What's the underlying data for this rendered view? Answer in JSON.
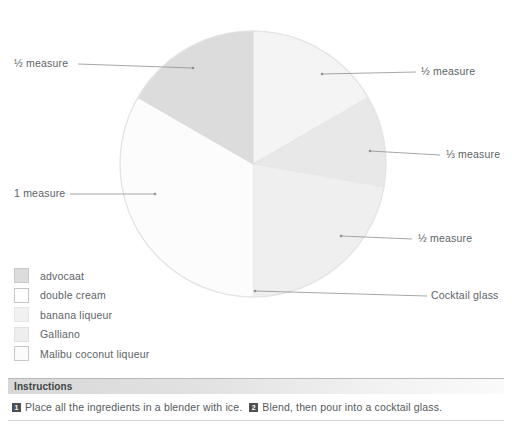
{
  "chart_data": {
    "type": "pie",
    "title": "",
    "center": {
      "x": 253,
      "y": 164
    },
    "radius": 133,
    "legend_position": "bottom-left",
    "grid": false,
    "categories": [
      "advocaat",
      "double cream",
      "banana liqueur",
      "Galliano",
      "Malibu coconut liqueur"
    ],
    "values": [
      0.5,
      1,
      0.5,
      0.333,
      0.5
    ],
    "value_labels": [
      "½ measure",
      "1 measure",
      "½ measure",
      "⅓ measure",
      "½ measure"
    ],
    "colors": [
      "#dcdcdc",
      "#fcfcfc",
      "#f3f3f3",
      "#e7e7e7",
      "#efefef"
    ],
    "annotations": [
      "Cocktail glass"
    ]
  },
  "pie": {
    "segments": [
      {
        "name": "advocaat",
        "label": "½ measure",
        "color": "#dcdcdc",
        "start": 300,
        "end": 360
      },
      {
        "name": "double cream",
        "label": "1 measure",
        "color": "#fcfcfc",
        "start": 180,
        "end": 300
      },
      {
        "name": "banana liqueur",
        "label": "½ measure",
        "color": "#f4f4f4",
        "start": 0,
        "end": 60
      },
      {
        "name": "Galliano",
        "label": "⅓ measure",
        "color": "#e8e8e8",
        "start": 60,
        "end": 100
      },
      {
        "name": "Malibu coconut liqueur",
        "label": "½ measure",
        "color": "#efefef",
        "start": 100,
        "end": 180
      }
    ],
    "glass_label": "Cocktail glass"
  },
  "callouts": {
    "top_left": "½ measure",
    "top_right": "½ measure",
    "mid_right": "⅓ measure",
    "low_right": "½ measure",
    "left": "1 measure",
    "bottom_right": "Cocktail glass"
  },
  "legend": {
    "items": [
      {
        "label": "advocaat",
        "color": "#dcdcdc",
        "border": "#c9c9c9"
      },
      {
        "label": "double cream",
        "color": "#ffffff",
        "border": "#c4c4c4"
      },
      {
        "label": "banana liqueur",
        "color": "#f1f1f1",
        "border": "#e0e0e0"
      },
      {
        "label": "Galliano",
        "color": "#eeeeee",
        "border": "#dcdcdc"
      },
      {
        "label": "Malibu coconut liqueur",
        "color": "#fbfbfb",
        "border": "#c8c8c8"
      }
    ]
  },
  "instructions": {
    "header": "Instructions",
    "steps": [
      {
        "num": "1",
        "text": "Place all the ingredients in a blender with ice."
      },
      {
        "num": "2",
        "text": "Blend, then pour into a cocktail glass."
      }
    ]
  }
}
